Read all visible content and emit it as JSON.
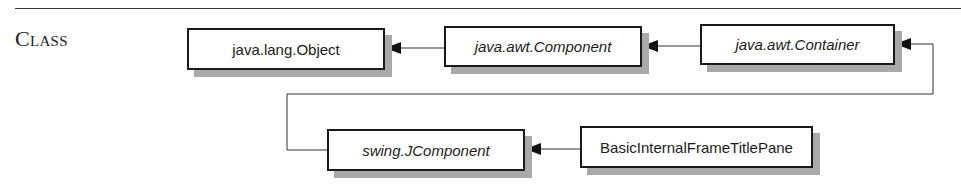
{
  "section": {
    "label": "Class"
  },
  "diagram": {
    "type": "class-hierarchy",
    "nodes": [
      {
        "id": "object",
        "label": "java.lang.Object",
        "italic": false
      },
      {
        "id": "component",
        "label": "java.awt.Component",
        "italic": true
      },
      {
        "id": "container",
        "label": "java.awt.Container",
        "italic": true
      },
      {
        "id": "jcomponent",
        "label": "swing.JComponent",
        "italic": true
      },
      {
        "id": "titlepane",
        "label": "BasicInternalFrameTitlePane",
        "italic": false
      }
    ],
    "edges": [
      {
        "from": "component",
        "to": "object"
      },
      {
        "from": "container",
        "to": "component"
      },
      {
        "from": "jcomponent",
        "to": "container"
      },
      {
        "from": "titlepane",
        "to": "jcomponent"
      }
    ],
    "colors": {
      "border": "#1a1a1a",
      "shadow": "#a9a9a9",
      "line": "#333333"
    }
  }
}
